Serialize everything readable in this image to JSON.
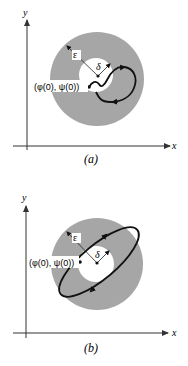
{
  "figure": {
    "colors": {
      "annulus_fill": "#a6a6a6",
      "inner_fill": "#ffffff",
      "stroke": "#111111",
      "axis": "#333333"
    },
    "panels": [
      {
        "id": "a",
        "caption": "(a)",
        "x_axis_label": "x",
        "y_axis_label": "y",
        "epsilon_label": "ε",
        "delta_label": "δ",
        "initial_point_label": "(φ(0), ψ(0))",
        "trajectory": "curve starting at initial point, leaving the δ-disk and looping inside the ε-disk"
      },
      {
        "id": "b",
        "caption": "(b)",
        "x_axis_label": "x",
        "y_axis_label": "y",
        "epsilon_label": "ε",
        "delta_label": "δ",
        "initial_point_label": "(φ(0), ψ(0))",
        "trajectory": "closed elliptical orbit through initial point, staying within the ε-disk"
      }
    ]
  }
}
